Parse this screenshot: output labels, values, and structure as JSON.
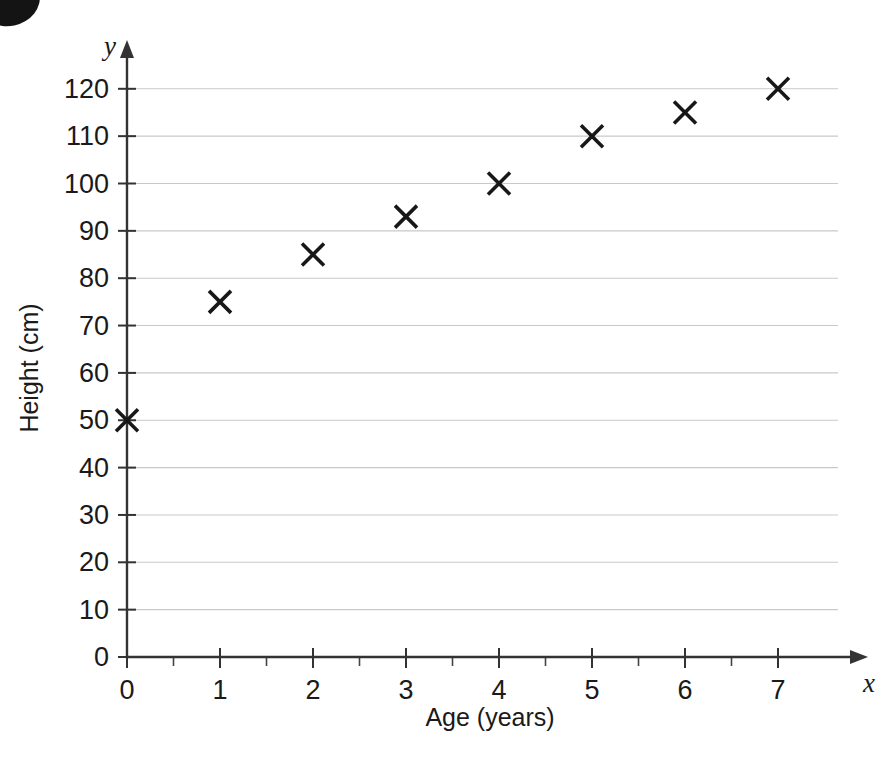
{
  "chart_data": {
    "type": "scatter",
    "title": "",
    "xlabel": "Age (years)",
    "ylabel": "Height (cm)",
    "x_axis_variable": "x",
    "y_axis_variable": "y",
    "x": [
      0,
      1,
      2,
      3,
      4,
      5,
      6,
      7
    ],
    "values": [
      50,
      75,
      85,
      93,
      100,
      110,
      115,
      120
    ],
    "points": [
      {
        "x": 0,
        "y": 50
      },
      {
        "x": 1,
        "y": 75
      },
      {
        "x": 2,
        "y": 85
      },
      {
        "x": 3,
        "y": 93
      },
      {
        "x": 4,
        "y": 100
      },
      {
        "x": 5,
        "y": 110
      },
      {
        "x": 6,
        "y": 115
      },
      {
        "x": 7,
        "y": 120
      }
    ],
    "xlim": [
      0,
      7
    ],
    "ylim": [
      0,
      120
    ],
    "x_ticks": [
      "0",
      "1",
      "2",
      "3",
      "4",
      "5",
      "6",
      "7"
    ],
    "x_tick_values": [
      0,
      1,
      2,
      3,
      4,
      5,
      6,
      7
    ],
    "x_minor_tick_step": 0.5,
    "y_ticks": [
      "0",
      "10",
      "20",
      "30",
      "40",
      "50",
      "60",
      "70",
      "80",
      "90",
      "100",
      "110",
      "120"
    ],
    "y_tick_values": [
      0,
      10,
      20,
      30,
      40,
      50,
      60,
      70,
      80,
      90,
      100,
      110,
      120
    ],
    "grid": "horizontal-only",
    "legend": "none",
    "marker_style": "x-cross",
    "colors": {
      "background": "#ffffff",
      "marker": "#171717",
      "axis": "#333333",
      "gridline": "#c9c9c9",
      "text": "#1a1a1a"
    }
  }
}
